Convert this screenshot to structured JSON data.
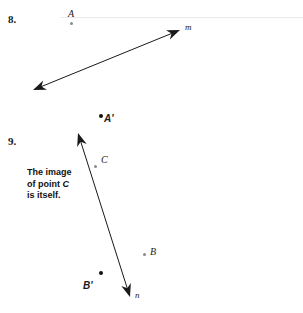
{
  "page": {
    "width": 303,
    "height": 313,
    "background": "#ffffff",
    "ink_color": "#1a1a1a",
    "dot_gray": "#8a8a8a",
    "dot_dark": "#111111",
    "scan_line_color": "#ebebeb"
  },
  "problems": [
    {
      "number": "8.",
      "number_pos": {
        "x": 8,
        "y": 14
      },
      "line": {
        "name": "m",
        "label": "m",
        "label_pos": {
          "x": 185,
          "y": 23
        },
        "x1": 33,
        "y1": 90,
        "x2": 180,
        "y2": 30,
        "arrow_start": true,
        "arrow_end": true
      },
      "points": [
        {
          "label": "A",
          "label_pos": {
            "x": 68,
            "y": 9
          },
          "dot_pos": {
            "x": 70,
            "y": 22
          },
          "dot_style": "gray",
          "dot_size": 3,
          "bold": false
        },
        {
          "label": "A'",
          "label_pos": {
            "x": 104,
            "y": 114
          },
          "dot_pos": {
            "x": 99,
            "y": 114
          },
          "dot_style": "dark",
          "dot_size": 4,
          "bold": true
        }
      ]
    },
    {
      "number": "9.",
      "number_pos": {
        "x": 8,
        "y": 136
      },
      "line": {
        "name": "n",
        "label": "n",
        "label_pos": {
          "x": 135,
          "y": 291
        },
        "x1": 78,
        "y1": 133,
        "x2": 130,
        "y2": 297,
        "arrow_start": true,
        "arrow_end": true
      },
      "points": [
        {
          "label": "C",
          "label_pos": {
            "x": 101,
            "y": 155
          },
          "dot_pos": {
            "x": 94,
            "y": 165
          },
          "dot_style": "gray",
          "dot_size": 3,
          "bold": false
        },
        {
          "label": "B",
          "label_pos": {
            "x": 150,
            "y": 247
          },
          "dot_pos": {
            "x": 143,
            "y": 253
          },
          "dot_style": "gray",
          "dot_size": 3,
          "bold": false
        },
        {
          "label": "B'",
          "label_pos": {
            "x": 83,
            "y": 281
          },
          "dot_pos": {
            "x": 99,
            "y": 271
          },
          "dot_style": "dark",
          "dot_size": 4,
          "bold": true
        }
      ],
      "note": {
        "pos": {
          "x": 27,
          "y": 167
        },
        "line1": "The image",
        "line2_prefix": "of point ",
        "line2_italic": "C",
        "line3": "is itself."
      }
    }
  ],
  "artifacts": {
    "top_scan_line": {
      "x": 60,
      "y": 17,
      "width": 243,
      "height": 1
    }
  }
}
